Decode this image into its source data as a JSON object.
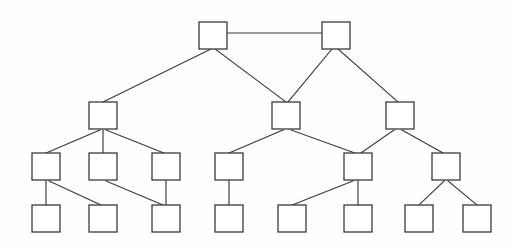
{
  "diagram": {
    "type": "node-link-graph",
    "background_color": "#fefefe",
    "node_fill_color": "#ffffff",
    "node_stroke_color": "#3a3a3a",
    "edge_color": "#3a3a3a",
    "node_width": 28,
    "node_height": 27,
    "levels": 4,
    "node_count": 19,
    "edge_count": 20,
    "nodes": [
      {
        "id": "n1",
        "label": "",
        "level": 0,
        "x": 199,
        "y": 22
      },
      {
        "id": "n2",
        "label": "",
        "level": 0,
        "x": 322,
        "y": 22
      },
      {
        "id": "n3",
        "label": "",
        "level": 1,
        "x": 89,
        "y": 102
      },
      {
        "id": "n4",
        "label": "",
        "level": 1,
        "x": 272,
        "y": 102
      },
      {
        "id": "n5",
        "label": "",
        "level": 1,
        "x": 386,
        "y": 102
      },
      {
        "id": "n6",
        "label": "",
        "level": 2,
        "x": 32,
        "y": 153
      },
      {
        "id": "n7",
        "label": "",
        "level": 2,
        "x": 89,
        "y": 153
      },
      {
        "id": "n8",
        "label": "",
        "level": 2,
        "x": 152,
        "y": 153
      },
      {
        "id": "n9",
        "label": "",
        "level": 2,
        "x": 215,
        "y": 153
      },
      {
        "id": "n10",
        "label": "",
        "level": 2,
        "x": 344,
        "y": 153
      },
      {
        "id": "n11",
        "label": "",
        "level": 2,
        "x": 432,
        "y": 153
      },
      {
        "id": "n12",
        "label": "",
        "level": 3,
        "x": 32,
        "y": 205
      },
      {
        "id": "n13",
        "label": "",
        "level": 3,
        "x": 89,
        "y": 205
      },
      {
        "id": "n14",
        "label": "",
        "level": 3,
        "x": 152,
        "y": 205
      },
      {
        "id": "n15",
        "label": "",
        "level": 3,
        "x": 215,
        "y": 205
      },
      {
        "id": "n16",
        "label": "",
        "level": 3,
        "x": 278,
        "y": 205
      },
      {
        "id": "n17",
        "label": "",
        "level": 3,
        "x": 344,
        "y": 205
      },
      {
        "id": "n18",
        "label": "",
        "level": 3,
        "x": 405,
        "y": 205
      },
      {
        "id": "n19",
        "label": "",
        "level": 3,
        "x": 463,
        "y": 205
      }
    ],
    "edges": [
      {
        "from": "n1",
        "to": "n2",
        "x1": 227,
        "y1": 33,
        "x2": 322,
        "y2": 33
      },
      {
        "from": "n1",
        "to": "n3",
        "x1": 211,
        "y1": 49,
        "x2": 103,
        "y2": 102
      },
      {
        "from": "n1",
        "to": "n4",
        "x1": 215,
        "y1": 49,
        "x2": 286,
        "y2": 102
      },
      {
        "from": "n2",
        "to": "n4",
        "x1": 332,
        "y1": 49,
        "x2": 288,
        "y2": 102
      },
      {
        "from": "n2",
        "to": "n5",
        "x1": 338,
        "y1": 49,
        "x2": 398,
        "y2": 102
      },
      {
        "from": "n3",
        "to": "n6",
        "x1": 100,
        "y1": 130,
        "x2": 46,
        "y2": 153
      },
      {
        "from": "n3",
        "to": "n7",
        "x1": 103,
        "y1": 130,
        "x2": 103,
        "y2": 153
      },
      {
        "from": "n3",
        "to": "n8",
        "x1": 106,
        "y1": 130,
        "x2": 164,
        "y2": 153
      },
      {
        "from": "n6",
        "to": "n12",
        "x1": 46,
        "y1": 181,
        "x2": 46,
        "y2": 205
      },
      {
        "from": "n6",
        "to": "n13",
        "x1": 49,
        "y1": 181,
        "x2": 101,
        "y2": 205
      },
      {
        "from": "n7",
        "to": "n14",
        "x1": 106,
        "y1": 181,
        "x2": 163,
        "y2": 205
      },
      {
        "from": "n8",
        "to": "n14",
        "x1": 166,
        "y1": 181,
        "x2": 166,
        "y2": 205
      },
      {
        "from": "n4",
        "to": "n9",
        "x1": 283,
        "y1": 130,
        "x2": 229,
        "y2": 153
      },
      {
        "from": "n4",
        "to": "n10",
        "x1": 291,
        "y1": 130,
        "x2": 355,
        "y2": 153
      },
      {
        "from": "n5",
        "to": "n10",
        "x1": 394,
        "y1": 130,
        "x2": 361,
        "y2": 153
      },
      {
        "from": "n5",
        "to": "n11",
        "x1": 402,
        "y1": 130,
        "x2": 443,
        "y2": 153
      },
      {
        "from": "n9",
        "to": "n15",
        "x1": 229,
        "y1": 181,
        "x2": 229,
        "y2": 205
      },
      {
        "from": "n10",
        "to": "n16",
        "x1": 353,
        "y1": 181,
        "x2": 292,
        "y2": 205
      },
      {
        "from": "n10",
        "to": "n17",
        "x1": 358,
        "y1": 181,
        "x2": 358,
        "y2": 205
      },
      {
        "from": "n11",
        "to": "n18",
        "x1": 444,
        "y1": 181,
        "x2": 419,
        "y2": 205
      },
      {
        "from": "n11",
        "to": "n19",
        "x1": 448,
        "y1": 181,
        "x2": 477,
        "y2": 205
      }
    ]
  }
}
